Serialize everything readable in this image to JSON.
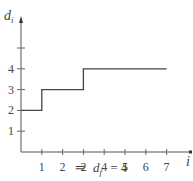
{
  "chart_data": {
    "type": "line",
    "subtype": "step",
    "title": "",
    "xlabel": "i",
    "ylabel": "d_i",
    "x_ticks": [
      1,
      2,
      3,
      4,
      5,
      6,
      7
    ],
    "x_tick_labels": [
      "1",
      "2",
      "2",
      "4",
      "5",
      "6",
      "7"
    ],
    "y_ticks": [
      1,
      2,
      3,
      4,
      5
    ],
    "y_tick_labels": [
      "1",
      "2",
      "3",
      "4",
      ""
    ],
    "xlim": [
      0,
      7.6
    ],
    "ylim": [
      0,
      5.6
    ],
    "grid": false,
    "legend": null,
    "series": [
      {
        "name": "d_i",
        "points": [
          [
            0,
            2
          ],
          [
            1,
            2
          ],
          [
            1,
            3
          ],
          [
            3,
            3
          ],
          [
            3,
            4
          ],
          [
            7,
            4
          ]
        ]
      }
    ],
    "annotation": "⇒ d_f = 4"
  },
  "labels": {
    "ylabel_main": "d",
    "ylabel_sub": "i",
    "xlabel": "i",
    "caption_arrow": "⇒",
    "caption_var": "d",
    "caption_sub": "f",
    "caption_rest": " = 4"
  }
}
